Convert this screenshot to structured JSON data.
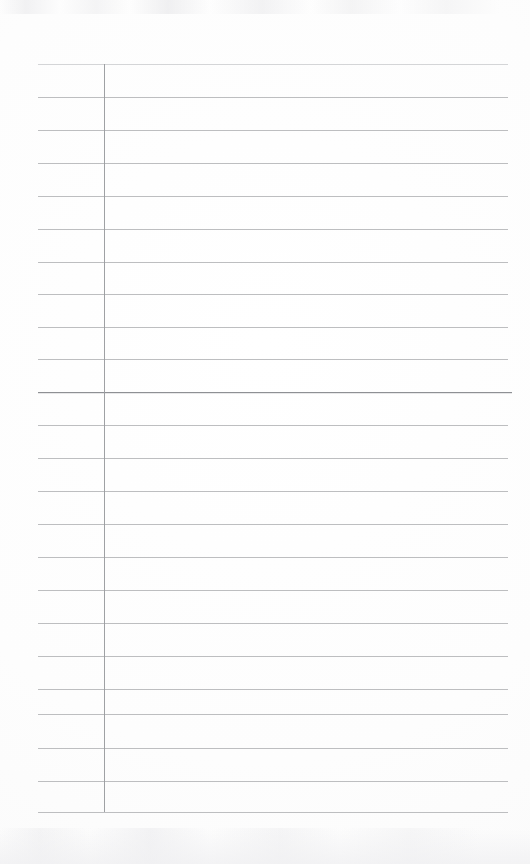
{
  "document": {
    "title": "Lined Notebook Page",
    "kind": "ruled-paper-scan",
    "page_width": 530,
    "page_height": 864,
    "background_color": "#fefefe",
    "rule_color": "#b9babd",
    "emphasis_rule_color": "#8e9094",
    "margin_rule_color": "#9a9c9f",
    "text_content": "",
    "handwriting_present": "none"
  },
  "layout": {
    "rules_left_x": 38,
    "rules_right_x": 508,
    "first_rule_y": 64,
    "last_rule_y": 812,
    "rule_spacing": 34,
    "rule_count": 23,
    "emphasis_rule_index": 9,
    "margin_rule_x": 104,
    "margin_rule_top_y": 64,
    "margin_rule_bottom_y": 812
  },
  "rules": [
    {
      "index": 0,
      "y": 64,
      "weight": "faint",
      "left": 38,
      "right": 508
    },
    {
      "index": 1,
      "y": 97,
      "weight": "normal",
      "left": 38,
      "right": 508
    },
    {
      "index": 2,
      "y": 130,
      "weight": "normal",
      "left": 38,
      "right": 508
    },
    {
      "index": 3,
      "y": 163,
      "weight": "normal",
      "left": 38,
      "right": 508
    },
    {
      "index": 4,
      "y": 196,
      "weight": "normal",
      "left": 38,
      "right": 508
    },
    {
      "index": 5,
      "y": 229,
      "weight": "normal",
      "left": 38,
      "right": 508
    },
    {
      "index": 6,
      "y": 262,
      "weight": "normal",
      "left": 38,
      "right": 508
    },
    {
      "index": 7,
      "y": 294,
      "weight": "normal",
      "left": 38,
      "right": 508
    },
    {
      "index": 8,
      "y": 327,
      "weight": "normal",
      "left": 38,
      "right": 508
    },
    {
      "index": 9,
      "y": 359,
      "weight": "normal",
      "left": 38,
      "right": 508
    },
    {
      "index": 10,
      "y": 392,
      "weight": "emphasis",
      "left": 38,
      "right": 512
    },
    {
      "index": 11,
      "y": 425,
      "weight": "normal",
      "left": 38,
      "right": 508
    },
    {
      "index": 12,
      "y": 458,
      "weight": "normal",
      "left": 38,
      "right": 508
    },
    {
      "index": 13,
      "y": 491,
      "weight": "normal",
      "left": 38,
      "right": 508
    },
    {
      "index": 14,
      "y": 524,
      "weight": "normal",
      "left": 38,
      "right": 508
    },
    {
      "index": 15,
      "y": 557,
      "weight": "normal",
      "left": 38,
      "right": 508
    },
    {
      "index": 16,
      "y": 590,
      "weight": "normal",
      "left": 38,
      "right": 508
    },
    {
      "index": 17,
      "y": 623,
      "weight": "normal",
      "left": 38,
      "right": 508
    },
    {
      "index": 18,
      "y": 656,
      "weight": "normal",
      "left": 38,
      "right": 508
    },
    {
      "index": 19,
      "y": 689,
      "weight": "normal",
      "left": 38,
      "right": 508
    },
    {
      "index": 20,
      "y": 714,
      "weight": "normal",
      "left": 38,
      "right": 508
    },
    {
      "index": 21,
      "y": 748,
      "weight": "normal",
      "left": 38,
      "right": 508
    },
    {
      "index": 22,
      "y": 781,
      "weight": "normal",
      "left": 38,
      "right": 508
    },
    {
      "index": 23,
      "y": 812,
      "weight": "normal",
      "left": 38,
      "right": 508
    }
  ]
}
